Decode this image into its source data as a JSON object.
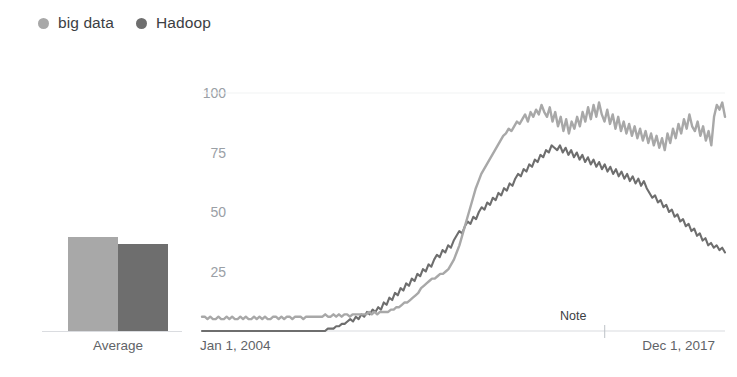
{
  "legend": {
    "items": [
      {
        "label": "big data",
        "color": "#a8a8a8",
        "icon": "series-dot-icon"
      },
      {
        "label": "Hadoop",
        "color": "#6e6e6e",
        "icon": "series-dot-icon"
      }
    ]
  },
  "bar_panel": {
    "caption": "Average"
  },
  "line_panel": {
    "x_start_label": "Jan 1, 2004",
    "x_end_label": "Dec 1, 2017",
    "note_label": "Note"
  },
  "colors": {
    "big_data": "#a8a8a8",
    "hadoop": "#6e6e6e",
    "axis": "#dadce0",
    "tick_text": "#9aa0a6",
    "label_text": "#5f6368"
  },
  "chart_data": [
    {
      "type": "bar",
      "title": "Average",
      "categories": [
        "big data",
        "Hadoop"
      ],
      "values": [
        40,
        37
      ],
      "xlabel": "Average",
      "ylabel": "",
      "ylim": [
        0,
        100
      ],
      "grid": false,
      "legend_position": "top-left"
    },
    {
      "type": "line",
      "title": "",
      "xlabel": "",
      "ylabel": "",
      "xlim": [
        "Jan 1, 2004",
        "Dec 1, 2017"
      ],
      "ylim": [
        0,
        100
      ],
      "yticks": [
        25,
        50,
        75,
        100
      ],
      "grid": false,
      "legend_position": "top-left",
      "annotations": [
        {
          "text": "Note",
          "x_fraction": 0.77,
          "y": 0
        }
      ],
      "series": [
        {
          "name": "big data",
          "color": "#a8a8a8",
          "values": [
            6,
            6,
            5,
            6,
            5,
            5,
            6,
            5,
            5,
            6,
            5,
            6,
            5,
            5,
            6,
            5,
            6,
            5,
            5,
            6,
            5,
            6,
            5,
            6,
            5,
            5,
            6,
            6,
            5,
            6,
            5,
            6,
            6,
            5,
            6,
            6,
            6,
            5,
            6,
            6,
            6,
            6,
            6,
            6,
            6,
            7,
            6,
            6,
            7,
            6,
            7,
            6,
            7,
            7,
            6,
            7,
            7,
            7,
            7,
            7,
            7,
            8,
            7,
            8,
            7,
            8,
            8,
            8,
            8,
            9,
            9,
            10,
            10,
            11,
            12,
            12,
            13,
            14,
            15,
            16,
            18,
            19,
            20,
            21,
            22,
            22,
            23,
            24,
            24,
            25,
            26,
            28,
            30,
            33,
            36,
            40,
            44,
            48,
            52,
            56,
            60,
            63,
            66,
            68,
            70,
            72,
            74,
            76,
            78,
            80,
            82,
            83,
            85,
            84,
            86,
            88,
            87,
            89,
            91,
            88,
            92,
            90,
            93,
            91,
            95,
            92,
            90,
            94,
            88,
            92,
            86,
            90,
            84,
            89,
            83,
            88,
            85,
            90,
            86,
            92,
            88,
            94,
            89,
            95,
            90,
            96,
            91,
            88,
            93,
            87,
            91,
            85,
            90,
            84,
            88,
            83,
            87,
            82,
            86,
            81,
            85,
            80,
            84,
            79,
            83,
            78,
            82,
            77,
            81,
            76,
            83,
            79,
            85,
            81,
            87,
            83,
            89,
            85,
            91,
            86,
            84,
            88,
            82,
            86,
            80,
            84,
            78,
            90,
            95,
            93,
            96,
            90
          ]
        },
        {
          "name": "Hadoop",
          "color": "#6e6e6e",
          "values": [
            0,
            0,
            0,
            0,
            0,
            0,
            0,
            0,
            0,
            0,
            0,
            0,
            0,
            0,
            0,
            0,
            0,
            0,
            0,
            0,
            0,
            0,
            0,
            0,
            0,
            0,
            0,
            0,
            0,
            0,
            0,
            0,
            0,
            0,
            0,
            0,
            0,
            0,
            0,
            0,
            0,
            0,
            0,
            0,
            0,
            1,
            1,
            1,
            2,
            2,
            3,
            3,
            4,
            5,
            4,
            6,
            5,
            7,
            6,
            8,
            7,
            9,
            8,
            10,
            9,
            12,
            11,
            14,
            13,
            16,
            15,
            18,
            17,
            20,
            19,
            22,
            21,
            24,
            23,
            26,
            25,
            28,
            27,
            30,
            32,
            31,
            34,
            33,
            36,
            35,
            38,
            40,
            42,
            41,
            44,
            46,
            45,
            48,
            47,
            50,
            52,
            51,
            54,
            53,
            56,
            55,
            58,
            57,
            60,
            59,
            62,
            61,
            64,
            66,
            65,
            68,
            67,
            70,
            69,
            72,
            71,
            74,
            73,
            76,
            75,
            78,
            77,
            76,
            78,
            75,
            77,
            74,
            76,
            73,
            75,
            72,
            74,
            71,
            73,
            70,
            72,
            69,
            71,
            68,
            70,
            67,
            69,
            66,
            68,
            65,
            67,
            64,
            66,
            63,
            65,
            62,
            64,
            61,
            63,
            60,
            58,
            56,
            57,
            54,
            55,
            52,
            53,
            50,
            51,
            48,
            49,
            46,
            47,
            44,
            45,
            42,
            43,
            40,
            41,
            38,
            39,
            36,
            37,
            35,
            36,
            34,
            35,
            33
          ]
        }
      ]
    }
  ]
}
